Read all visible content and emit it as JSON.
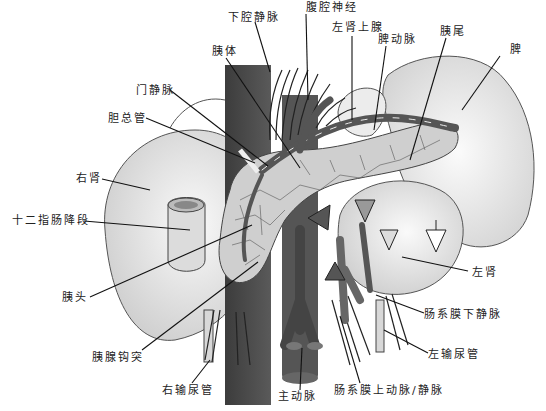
{
  "labels": [
    {
      "id": "ivc",
      "text": "下腔静脉",
      "x": 228,
      "y": 12,
      "lx": 270,
      "ly": 72,
      "ax": 255,
      "ay": 22
    },
    {
      "id": "celiac-nerve",
      "text": "腹腔神经",
      "x": 306,
      "y": 2,
      "lx": 308,
      "ly": 100,
      "ax": 306,
      "ay": 14
    },
    {
      "id": "left-adrenal",
      "text": "左肾上腺",
      "x": 332,
      "y": 22,
      "lx": 352,
      "ly": 120,
      "ax": 352,
      "ay": 36
    },
    {
      "id": "splenic-artery",
      "text": "脾动脉",
      "x": 378,
      "y": 34,
      "lx": 374,
      "ly": 130,
      "ax": 386,
      "ay": 46
    },
    {
      "id": "pancreas-tail",
      "text": "胰尾",
      "x": 440,
      "y": 26,
      "lx": 410,
      "ly": 160,
      "ax": 446,
      "ay": 38
    },
    {
      "id": "spleen",
      "text": "脾",
      "x": 510,
      "y": 44,
      "lx": 462,
      "ly": 110,
      "ax": 500,
      "ay": 56
    },
    {
      "id": "pancreas-body",
      "text": "胰体",
      "x": 212,
      "y": 46,
      "lx": 300,
      "ly": 168,
      "ax": 226,
      "ay": 58
    },
    {
      "id": "portal-vein",
      "text": "门静脉",
      "x": 136,
      "y": 85,
      "lx": 268,
      "ly": 166,
      "ax": 170,
      "ay": 90
    },
    {
      "id": "common-bile-duct",
      "text": "胆总管",
      "x": 108,
      "y": 113,
      "lx": 255,
      "ly": 163,
      "ax": 146,
      "ay": 118
    },
    {
      "id": "right-kidney",
      "text": "右肾",
      "x": 76,
      "y": 173,
      "lx": 150,
      "ly": 190,
      "ax": 102,
      "ay": 179
    },
    {
      "id": "duodenum",
      "text": "十二指肠降段",
      "x": 12,
      "y": 215,
      "lx": 190,
      "ly": 230,
      "ax": 84,
      "ay": 221
    },
    {
      "id": "pancreas-head",
      "text": "胰头",
      "x": 62,
      "y": 292,
      "lx": 252,
      "ly": 225,
      "ax": 90,
      "ay": 297
    },
    {
      "id": "uncinate",
      "text": "胰腺钩突",
      "x": 92,
      "y": 352,
      "lx": 258,
      "ly": 262,
      "ax": 142,
      "ay": 350
    },
    {
      "id": "right-ureter",
      "text": "右输尿管",
      "x": 162,
      "y": 385,
      "lx": 210,
      "ly": 360,
      "ax": 192,
      "ay": 383
    },
    {
      "id": "aorta",
      "text": "主动脉",
      "x": 278,
      "y": 391,
      "lx": 302,
      "ly": 348,
      "ax": 300,
      "ay": 390
    },
    {
      "id": "sma-smv",
      "text": "肠系膜上动脉/静脉",
      "x": 334,
      "y": 385,
      "lx": 340,
      "ly": 316,
      "ax": 360,
      "ay": 383
    },
    {
      "id": "left-ureter",
      "text": "左输尿管",
      "x": 428,
      "y": 349,
      "lx": 384,
      "ly": 330,
      "ax": 428,
      "ay": 353
    },
    {
      "id": "imv",
      "text": "肠系膜下静脉",
      "x": 424,
      "y": 309,
      "lx": 376,
      "ly": 295,
      "ax": 424,
      "ay": 313
    },
    {
      "id": "left-kidney",
      "text": "左肾",
      "x": 472,
      "y": 267,
      "lx": 402,
      "ly": 257,
      "ax": 468,
      "ay": 271
    }
  ],
  "colors": {
    "organ_fill": "#e6e6e6",
    "organ_stroke": "#444444",
    "vessel_dark": "#4a4a4a",
    "vessel_mid": "#6e6e6e",
    "pancreas": "#c8c8c8",
    "line": "#111111"
  }
}
